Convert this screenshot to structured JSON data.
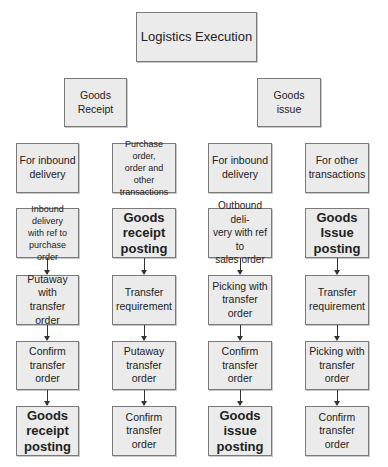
{
  "diagram": {
    "root": {
      "label": "Logistics Execution"
    },
    "branches": [
      {
        "label": "Goods\nReceipt"
      },
      {
        "label": "Goods\nissue"
      }
    ],
    "columns": [
      {
        "header": "For inbound\ndelivery",
        "steps": [
          "Inbound delivery\nwith ref to\npurchase order",
          "Putaway with\ntransfer order",
          "Confirm\ntransfer\norder",
          "Goods\nreceipt\nposting"
        ]
      },
      {
        "header": "Purchase order,\norder and other\ntransactions",
        "steps": [
          "Goods\nreceipt\nposting",
          "Transfer\nrequirement",
          "Putaway\ntransfer\norder",
          "Confirm\ntransfer\norder"
        ]
      },
      {
        "header": "For inbound\ndelivery",
        "steps": [
          "Outbound deli-\nvery with ref to\nsales order",
          "Picking with\ntransfer order",
          "Confirm\ntransfer\norder",
          "Goods\nissue\nposting"
        ]
      },
      {
        "header": "For other\ntransactions",
        "steps": [
          "Goods\nIssue\nposting",
          "Transfer\nrequirement",
          "Picking with\ntransfer order",
          "Confirm\ntransfer\norder"
        ]
      }
    ]
  },
  "colors": {
    "box_fill": "#ebebeb",
    "box_border": "#7a7a7a",
    "arrow": "#333333"
  }
}
